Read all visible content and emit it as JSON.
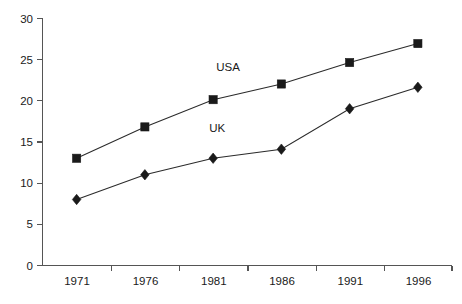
{
  "chart_data": {
    "type": "line",
    "title": "",
    "subtitle": "",
    "xlabel": "",
    "ylabel": "",
    "categories": [
      "1971",
      "1976",
      "1981",
      "1986",
      "1991",
      "1996"
    ],
    "x": [
      1971,
      1976,
      1981,
      1986,
      1991,
      1996
    ],
    "series": [
      {
        "name": "USA",
        "marker": "square",
        "color": "#1a1a1a",
        "values": [
          13,
          16.8,
          20.1,
          22,
          24.6,
          26.9
        ],
        "label_text": "USA",
        "label_x": 1982.1,
        "label_y": 23.6
      },
      {
        "name": "UK",
        "marker": "diamond",
        "color": "#1a1a1a",
        "values": [
          8,
          11,
          13,
          14.1,
          19,
          21.6
        ],
        "label_text": "UK",
        "label_x": 1981.3,
        "label_y": 16.2
      }
    ],
    "yticks": [
      0,
      5,
      10,
      15,
      20,
      25,
      30
    ],
    "ytick_labels": [
      "0",
      "5",
      "10",
      "15",
      "20",
      "25",
      "30"
    ],
    "ylim": [
      0,
      30
    ],
    "xtick_labels": [
      "1971",
      "1976",
      "1981",
      "1986",
      "1991",
      "1996"
    ],
    "grid": false,
    "legend": "inline-annotations",
    "legend_position": "inline",
    "annotations": [
      {
        "text": "USA",
        "series": "USA"
      },
      {
        "text": "UK",
        "series": "UK"
      }
    ],
    "background_color": "#ffffff",
    "axis_color": "#555555",
    "line_color": "#2b2b2b"
  }
}
